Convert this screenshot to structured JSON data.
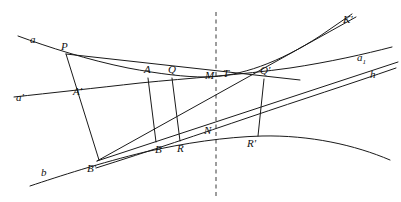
{
  "figure": {
    "background_color": "#ffffff",
    "ink_color": "#1a1a1a",
    "axis_color": "#3a3a3a",
    "width": 401,
    "height": 202
  },
  "labels": {
    "a": "a",
    "P": "P",
    "a_prime": "a'",
    "A": "A",
    "A_prime": "A'",
    "Q": "Q",
    "M": "M",
    "T": "T",
    "Q_prime": "Q'",
    "K_prime": "K'",
    "a_sub1": "a",
    "a_sub1_sub": "1",
    "h": "h",
    "b": "b",
    "B": "B",
    "B_prime": "B'",
    "R": "R",
    "R_prime": "R'",
    "N": "N"
  },
  "points": [
    {
      "id": "a",
      "label": "a",
      "x": 33,
      "y": 43
    },
    {
      "id": "P",
      "label": "P",
      "x": 64,
      "y": 50
    },
    {
      "id": "a_prime",
      "label": "a'",
      "x": 20,
      "y": 98
    },
    {
      "id": "A_prime",
      "label": "A'",
      "x": 78,
      "y": 92
    },
    {
      "id": "A",
      "label": "A",
      "x": 147,
      "y": 73
    },
    {
      "id": "Q",
      "label": "Q",
      "x": 171,
      "y": 73
    },
    {
      "id": "M",
      "label": "M",
      "x": 210,
      "y": 76
    },
    {
      "id": "T",
      "label": "T",
      "x": 227,
      "y": 75
    },
    {
      "id": "Q_prime",
      "label": "Q'",
      "x": 265,
      "y": 74
    },
    {
      "id": "K_prime",
      "label": "K'",
      "x": 347,
      "y": 20
    },
    {
      "id": "a_sub1",
      "label": "a1",
      "x": 361,
      "y": 58
    },
    {
      "id": "h",
      "label": "h",
      "x": 372,
      "y": 74
    },
    {
      "id": "b",
      "label": "b",
      "x": 44,
      "y": 173
    },
    {
      "id": "B_prime",
      "label": "B'",
      "x": 92,
      "y": 167
    },
    {
      "id": "B",
      "label": "B",
      "x": 159,
      "y": 148
    },
    {
      "id": "R",
      "label": "R",
      "x": 181,
      "y": 147
    },
    {
      "id": "N",
      "label": "N",
      "x": 208,
      "y": 131
    },
    {
      "id": "R_prime",
      "label": "R'",
      "x": 252,
      "y": 143
    }
  ],
  "elements": {
    "curves": [
      {
        "name": "curve-a-upper",
        "description": "upper curve through a, P, A, M rising to K' region"
      },
      {
        "name": "curve-a-prime",
        "description": "middle curve through a', A', Q, T, Q'"
      },
      {
        "name": "curve-b-lower",
        "description": "lower curve through b, B', B, R, N, R'"
      },
      {
        "name": "curve-h-right",
        "description": "right-hand curve labelled h"
      }
    ],
    "rays": [
      {
        "name": "ray-P-to-A",
        "from": "P",
        "to": "A"
      },
      {
        "name": "ray-P-to-B-prime",
        "from": "P",
        "to": "B'"
      },
      {
        "name": "ray-B-prime-to-K-prime",
        "from": "B'",
        "to": "K'"
      },
      {
        "name": "ray-B-prime-to-h",
        "from": "B'",
        "to": "h"
      }
    ],
    "chords": [
      {
        "name": "chord-A-B",
        "from": "A",
        "to": "B"
      },
      {
        "name": "chord-Q-R",
        "from": "Q",
        "to": "R"
      },
      {
        "name": "chord-Q-prime-R-prime",
        "from": "Q'",
        "to": "R'"
      }
    ],
    "axis": {
      "name": "vertical-dashed-axis",
      "x": 216,
      "y_top": 12,
      "y_bottom": 196
    }
  }
}
